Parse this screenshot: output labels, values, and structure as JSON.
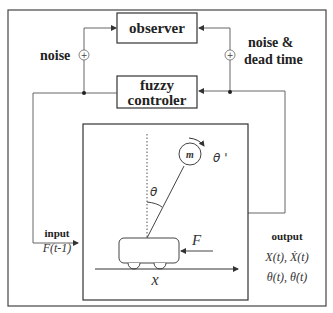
{
  "diagram": {
    "blocks": {
      "observer": "observer",
      "fuzzy_line1": "fuzzy",
      "fuzzy_line2": "controler"
    },
    "labels": {
      "noise_left": "noise",
      "noise_right_line1": "noise &",
      "noise_right_line2": "dead time",
      "input_title": "input",
      "input_expr": "F(t-1)",
      "output_title": "output",
      "output_line1": "X(t), Ẋ(t)",
      "output_line2": "θ(t), θ̇(t)"
    },
    "plant": {
      "mass": "m",
      "angle": "θ",
      "angular_velocity": "θ '",
      "force": "F",
      "position": "x"
    },
    "summing_junction_symbol": "+",
    "colors": {
      "line": "#555555",
      "border": "#444444",
      "text": "#222222"
    }
  }
}
